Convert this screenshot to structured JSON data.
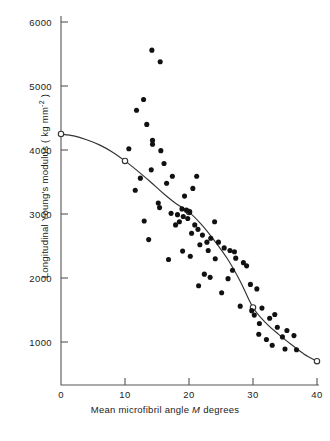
{
  "chart_data": {
    "type": "scatter",
    "title": "",
    "xlabel": "Mean microfibril angle M degrees",
    "ylabel": "Longitudinal Young's modulus (kg mm⁻²)",
    "ylabel_main": "Longitudinal Young's modulus  ( kg mm",
    "ylabel_exp": "-2",
    "ylabel_tail": " )",
    "xlabel_pre": "Mean microfibril angle ",
    "xlabel_sym": "M",
    "xlabel_post": " degrees",
    "xlim": [
      0,
      40
    ],
    "ylim": [
      0,
      6000
    ],
    "xticks": [
      0,
      10,
      20,
      30,
      40
    ],
    "xticklabels": [
      "0",
      "10",
      "20",
      "30",
      "40"
    ],
    "yticks": [
      1000,
      2000,
      3000,
      4000,
      5000,
      6000
    ],
    "yticklabels": [
      "1000",
      "2000",
      "3000",
      "4000",
      "5000",
      "6000"
    ],
    "grid": false,
    "legend": "none",
    "axis_color": "#555555",
    "marker_color": "#111111",
    "curve_color": "#333333",
    "series": [
      {
        "name": "observations",
        "marker": "filled-circle",
        "points": [
          [
            14.2,
            5560
          ],
          [
            15.5,
            5380
          ],
          [
            12.9,
            4790
          ],
          [
            11.8,
            4620
          ],
          [
            13.4,
            4400
          ],
          [
            14.3,
            4090
          ],
          [
            14.3,
            4150
          ],
          [
            15.6,
            3990
          ],
          [
            10.6,
            4020
          ],
          [
            16.1,
            3790
          ],
          [
            14.1,
            3690
          ],
          [
            17.4,
            3590
          ],
          [
            16.5,
            3480
          ],
          [
            12.4,
            3560
          ],
          [
            11.6,
            3370
          ],
          [
            21.2,
            3590
          ],
          [
            19.3,
            3280
          ],
          [
            20.6,
            3400
          ],
          [
            15.2,
            3170
          ],
          [
            15.4,
            3100
          ],
          [
            18.9,
            3080
          ],
          [
            19.6,
            3060
          ],
          [
            17.2,
            3010
          ],
          [
            18.2,
            2990
          ],
          [
            19.1,
            2960
          ],
          [
            19.8,
            2930
          ],
          [
            20.1,
            3030
          ],
          [
            18.5,
            2880
          ],
          [
            17.9,
            2830
          ],
          [
            13.0,
            2890
          ],
          [
            13.7,
            2600
          ],
          [
            20.9,
            2830
          ],
          [
            21.4,
            2760
          ],
          [
            20.4,
            2700
          ],
          [
            22.1,
            2670
          ],
          [
            22.8,
            2560
          ],
          [
            21.7,
            2520
          ],
          [
            23.4,
            2620
          ],
          [
            24.6,
            2560
          ],
          [
            23.0,
            2430
          ],
          [
            25.5,
            2470
          ],
          [
            26.4,
            2430
          ],
          [
            20.2,
            2340
          ],
          [
            24.1,
            2300
          ],
          [
            27.3,
            2310
          ],
          [
            28.5,
            2240
          ],
          [
            29.0,
            2190
          ],
          [
            22.4,
            2060
          ],
          [
            23.3,
            2010
          ],
          [
            26.1,
            1990
          ],
          [
            26.8,
            2120
          ],
          [
            29.6,
            1900
          ],
          [
            21.5,
            1880
          ],
          [
            30.6,
            1830
          ],
          [
            25.1,
            1770
          ],
          [
            28.0,
            1560
          ],
          [
            31.4,
            1530
          ],
          [
            29.8,
            1490
          ],
          [
            30.2,
            1420
          ],
          [
            32.6,
            1370
          ],
          [
            33.4,
            1430
          ],
          [
            31.0,
            1290
          ],
          [
            33.8,
            1230
          ],
          [
            30.9,
            1120
          ],
          [
            32.1,
            1040
          ],
          [
            34.6,
            1080
          ],
          [
            35.3,
            1180
          ],
          [
            36.4,
            1100
          ],
          [
            33.0,
            950
          ],
          [
            35.0,
            890
          ],
          [
            36.8,
            880
          ],
          [
            27.1,
            2410
          ],
          [
            24.0,
            2880
          ],
          [
            19.0,
            2420
          ],
          [
            16.8,
            2290
          ]
        ]
      }
    ],
    "fitted_curve": {
      "name": "fitted curve",
      "marker": "open-circle",
      "nodes": [
        [
          0,
          4250
        ],
        [
          10,
          3830
        ],
        [
          20,
          3030
        ],
        [
          30,
          1540
        ],
        [
          40,
          700
        ]
      ],
      "path": [
        [
          0,
          4250
        ],
        [
          2,
          4220
        ],
        [
          4,
          4160
        ],
        [
          6,
          4080
        ],
        [
          8,
          3970
        ],
        [
          10,
          3830
        ],
        [
          12,
          3670
        ],
        [
          14,
          3500
        ],
        [
          16,
          3320
        ],
        [
          18,
          3160
        ],
        [
          20,
          3030
        ],
        [
          22,
          2830
        ],
        [
          24,
          2580
        ],
        [
          26,
          2300
        ],
        [
          28,
          1950
        ],
        [
          30,
          1540
        ],
        [
          32,
          1300
        ],
        [
          34,
          1120
        ],
        [
          36,
          960
        ],
        [
          38,
          810
        ],
        [
          40,
          700
        ]
      ]
    }
  }
}
